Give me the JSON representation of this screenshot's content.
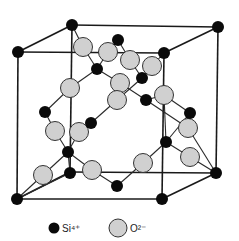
{
  "diagram": {
    "colors": {
      "edge": "#1a1a1a",
      "bond": "#2a2a2a",
      "si_fill": "#0a0a0a",
      "o_fill": "#d0d0d0",
      "o_stroke": "#333333",
      "background": "#ffffff"
    },
    "cube": {
      "back_top_left": [
        72,
        25
      ],
      "back_top_right": [
        218,
        27
      ],
      "front_top_left": [
        18,
        52
      ],
      "front_top_right": [
        164,
        53
      ],
      "front_bottom_left": [
        17,
        199
      ],
      "front_bottom_right": [
        162,
        199
      ],
      "back_bottom_right": [
        216,
        173
      ],
      "back_bottom_left": [
        70,
        172
      ]
    },
    "si_atoms": [
      [
        72,
        25
      ],
      [
        218,
        27
      ],
      [
        18,
        52
      ],
      [
        164,
        53
      ],
      [
        17,
        199
      ],
      [
        162,
        199
      ],
      [
        216,
        173
      ],
      [
        118,
        40
      ],
      [
        97,
        69
      ],
      [
        142,
        78
      ],
      [
        146,
        100
      ],
      [
        45,
        112
      ],
      [
        91,
        123
      ],
      [
        190,
        113
      ],
      [
        68,
        152
      ],
      [
        166,
        142
      ],
      [
        70,
        173
      ],
      [
        117,
        186
      ]
    ],
    "o_atoms": [
      [
        83,
        47
      ],
      [
        108,
        52
      ],
      [
        130,
        60
      ],
      [
        152,
        66
      ],
      [
        70,
        88
      ],
      [
        120,
        83
      ],
      [
        117,
        100
      ],
      [
        164,
        95
      ],
      [
        55,
        131
      ],
      [
        79,
        132
      ],
      [
        188,
        128
      ],
      [
        43,
        175
      ],
      [
        92,
        170
      ],
      [
        143,
        163
      ],
      [
        190,
        157
      ]
    ],
    "bonds": [
      [
        [
          72,
          25
        ],
        [
          83,
          47
        ]
      ],
      [
        [
          83,
          47
        ],
        [
          97,
          69
        ]
      ],
      [
        [
          97,
          69
        ],
        [
          108,
          52
        ]
      ],
      [
        [
          108,
          52
        ],
        [
          118,
          40
        ]
      ],
      [
        [
          118,
          40
        ],
        [
          130,
          60
        ]
      ],
      [
        [
          130,
          60
        ],
        [
          142,
          78
        ]
      ],
      [
        [
          142,
          78
        ],
        [
          152,
          66
        ]
      ],
      [
        [
          152,
          66
        ],
        [
          164,
          53
        ]
      ],
      [
        [
          97,
          69
        ],
        [
          70,
          88
        ]
      ],
      [
        [
          70,
          88
        ],
        [
          45,
          112
        ]
      ],
      [
        [
          97,
          69
        ],
        [
          120,
          83
        ]
      ],
      [
        [
          120,
          83
        ],
        [
          146,
          100
        ]
      ],
      [
        [
          142,
          78
        ],
        [
          117,
          100
        ]
      ],
      [
        [
          117,
          100
        ],
        [
          91,
          123
        ]
      ],
      [
        [
          146,
          100
        ],
        [
          164,
          95
        ]
      ],
      [
        [
          146,
          100
        ],
        [
          188,
          128
        ]
      ],
      [
        [
          164,
          95
        ],
        [
          190,
          113
        ]
      ],
      [
        [
          188,
          128
        ],
        [
          216,
          173
        ]
      ],
      [
        [
          45,
          112
        ],
        [
          55,
          131
        ]
      ],
      [
        [
          55,
          131
        ],
        [
          68,
          152
        ]
      ],
      [
        [
          91,
          123
        ],
        [
          79,
          132
        ]
      ],
      [
        [
          79,
          132
        ],
        [
          68,
          152
        ]
      ],
      [
        [
          68,
          152
        ],
        [
          43,
          175
        ]
      ],
      [
        [
          43,
          175
        ],
        [
          17,
          199
        ]
      ],
      [
        [
          68,
          152
        ],
        [
          70,
          173
        ]
      ],
      [
        [
          70,
          173
        ],
        [
          17,
          199
        ]
      ],
      [
        [
          68,
          152
        ],
        [
          92,
          170
        ]
      ],
      [
        [
          92,
          170
        ],
        [
          117,
          186
        ]
      ],
      [
        [
          117,
          186
        ],
        [
          143,
          163
        ]
      ],
      [
        [
          143,
          163
        ],
        [
          166,
          142
        ]
      ],
      [
        [
          166,
          142
        ],
        [
          190,
          157
        ]
      ],
      [
        [
          190,
          157
        ],
        [
          216,
          173
        ]
      ],
      [
        [
          166,
          142
        ],
        [
          164,
          95
        ]
      ],
      [
        [
          190,
          113
        ],
        [
          166,
          142
        ]
      ]
    ],
    "legend": {
      "si_label": "Si⁴⁺",
      "o_label": "O²⁻",
      "si_marker": [
        54,
        228
      ],
      "o_marker": [
        118,
        228
      ]
    }
  }
}
